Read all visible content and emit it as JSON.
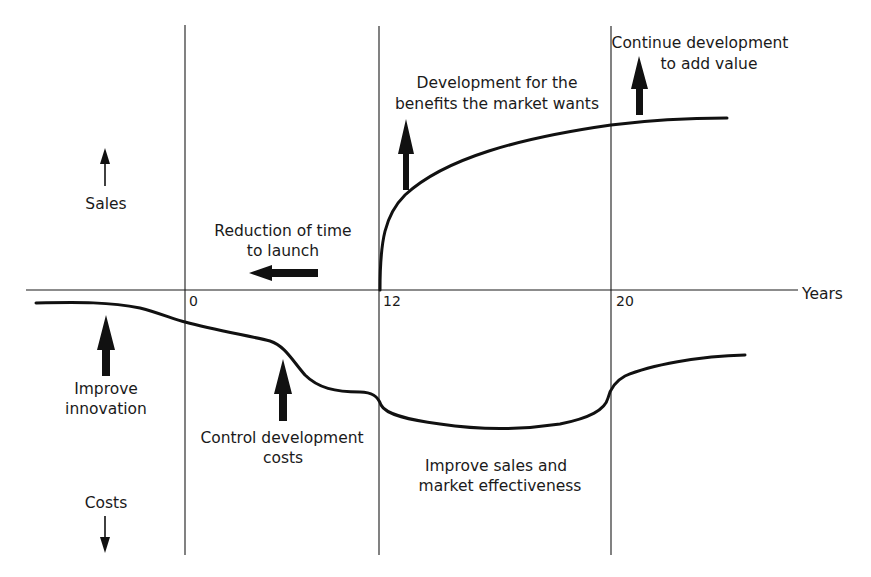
{
  "diagram": {
    "axis": {
      "x_label": "Years",
      "ticks": [
        "0",
        "12",
        "20"
      ],
      "up_label": "Sales",
      "down_label": "Costs"
    },
    "annotations": {
      "reduction_line1": "Reduction of time",
      "reduction_line2": "to launch",
      "development_line1": "Development for the",
      "development_line2": "benefits the market wants",
      "continue_line1": "Continue development",
      "continue_line2": "to add value",
      "innovation_line1": "Improve",
      "innovation_line2": "innovation",
      "control_line1": "Control development",
      "control_line2": "costs",
      "sales_eff_line1": "Improve sales and",
      "sales_eff_line2": "market effectiveness"
    },
    "curves": {
      "sales": "Sales curve rising steeply from year 12, flattening after year 20",
      "costs": "Cost curve declining before year 0, dropping through development, lowest between 12 and 20, recovering after 20"
    },
    "colors": {
      "ink": "#111111",
      "background": "#ffffff"
    }
  }
}
